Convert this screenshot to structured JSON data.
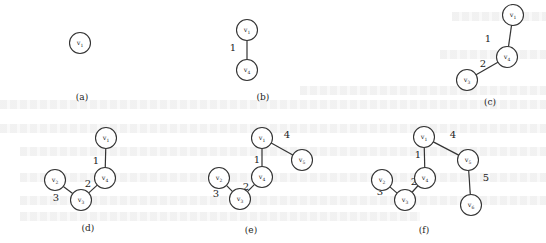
{
  "figure": {
    "panels": [
      {
        "id": "a",
        "caption": "(a)",
        "caption_pos": [
          82,
          97
        ],
        "nodes": [
          {
            "id": "v1",
            "label": "v",
            "sub": "1",
            "x": 80,
            "y": 43
          }
        ],
        "edges": []
      },
      {
        "id": "b",
        "caption": "(b)",
        "caption_pos": [
          263,
          97
        ],
        "nodes": [
          {
            "id": "v1",
            "label": "v",
            "sub": "1",
            "x": 247,
            "y": 30
          },
          {
            "id": "v4",
            "label": "v",
            "sub": "4",
            "x": 247,
            "y": 70
          }
        ],
        "edges": [
          {
            "from": "v1",
            "to": "v4",
            "weight": "1",
            "label_pos": [
              233,
              47
            ]
          }
        ]
      },
      {
        "id": "c",
        "caption": "(c)",
        "caption_pos": [
          490,
          102
        ],
        "nodes": [
          {
            "id": "v2",
            "label": "v",
            "sub": "1",
            "x": 513,
            "y": 15
          },
          {
            "id": "v4",
            "label": "v",
            "sub": "4",
            "x": 507,
            "y": 57
          },
          {
            "id": "v3",
            "label": "v",
            "sub": "3",
            "x": 467,
            "y": 80
          }
        ],
        "edges": [
          {
            "from": "v2",
            "to": "v4",
            "weight": "1",
            "label_pos": [
              488,
              38
            ]
          },
          {
            "from": "v4",
            "to": "v3",
            "weight": "2",
            "label_pos": [
              483,
              63
            ]
          }
        ]
      },
      {
        "id": "d",
        "caption": "(d)",
        "caption_pos": [
          88,
          228
        ],
        "nodes": [
          {
            "id": "v1",
            "label": "v",
            "sub": "1",
            "x": 106,
            "y": 138
          },
          {
            "id": "v4",
            "label": "v",
            "sub": "4",
            "x": 105,
            "y": 178
          },
          {
            "id": "v2",
            "label": "v",
            "sub": "2",
            "x": 55,
            "y": 180
          },
          {
            "id": "v3",
            "label": "v",
            "sub": "3",
            "x": 81,
            "y": 200
          }
        ],
        "edges": [
          {
            "from": "v1",
            "to": "v4",
            "weight": "1",
            "label_pos": [
              96,
              160
            ]
          },
          {
            "from": "v4",
            "to": "v3",
            "weight": "2",
            "label_pos": [
              88,
              183
            ]
          },
          {
            "from": "v2",
            "to": "v3",
            "weight": "3",
            "label_pos": [
              56,
              197
            ]
          }
        ]
      },
      {
        "id": "e",
        "caption": "(e)",
        "caption_pos": [
          251,
          230
        ],
        "nodes": [
          {
            "id": "v1",
            "label": "v",
            "sub": "1",
            "x": 262,
            "y": 138
          },
          {
            "id": "v4",
            "label": "v",
            "sub": "4",
            "x": 262,
            "y": 177
          },
          {
            "id": "v5",
            "label": "v",
            "sub": "5",
            "x": 302,
            "y": 160
          },
          {
            "id": "v2",
            "label": "v",
            "sub": "2",
            "x": 219,
            "y": 178
          },
          {
            "id": "v3",
            "label": "v",
            "sub": "3",
            "x": 240,
            "y": 199
          }
        ],
        "edges": [
          {
            "from": "v1",
            "to": "v4",
            "weight": "1",
            "label_pos": [
              257,
              159
            ]
          },
          {
            "from": "v1",
            "to": "v5",
            "weight": "4",
            "label_pos": [
              287,
              134
            ]
          },
          {
            "from": "v4",
            "to": "v3",
            "weight": "2",
            "label_pos": [
              246,
              186
            ]
          },
          {
            "from": "v2",
            "to": "v3",
            "weight": "3",
            "label_pos": [
              216,
              193
            ]
          }
        ]
      },
      {
        "id": "f",
        "caption": "(f)",
        "caption_pos": [
          424,
          230
        ],
        "nodes": [
          {
            "id": "v1",
            "label": "v",
            "sub": "1",
            "x": 424,
            "y": 137
          },
          {
            "id": "v4",
            "label": "v",
            "sub": "4",
            "x": 425,
            "y": 178
          },
          {
            "id": "v5",
            "label": "v",
            "sub": "5",
            "x": 468,
            "y": 160
          },
          {
            "id": "v6",
            "label": "v",
            "sub": "6",
            "x": 471,
            "y": 205
          },
          {
            "id": "v2",
            "label": "v",
            "sub": "2",
            "x": 382,
            "y": 180
          },
          {
            "id": "v3",
            "label": "v",
            "sub": "3",
            "x": 405,
            "y": 200
          }
        ],
        "edges": [
          {
            "from": "v1",
            "to": "v4",
            "weight": "1",
            "label_pos": [
              418,
              154
            ]
          },
          {
            "from": "v1",
            "to": "v5",
            "weight": "4",
            "label_pos": [
              453,
              134
            ]
          },
          {
            "from": "v4",
            "to": "v3",
            "weight": "2",
            "label_pos": [
              414,
              181
            ]
          },
          {
            "from": "v2",
            "to": "v3",
            "weight": "3",
            "label_pos": [
              380,
              191
            ]
          },
          {
            "from": "v5",
            "to": "v6",
            "weight": "5",
            "label_pos": [
              486,
              177
            ]
          }
        ]
      }
    ],
    "node_radius": 10.5,
    "colors": {
      "stroke": "#333333",
      "text": "#222222",
      "background": "#ffffff",
      "bleed_through": "#ededed"
    }
  }
}
